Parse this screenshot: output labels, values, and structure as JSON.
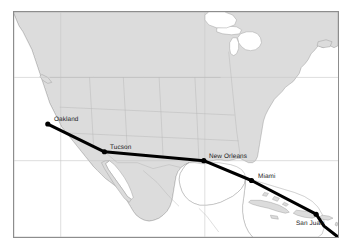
{
  "figure": {
    "type": "route-map",
    "title": "",
    "frame": {
      "x": 13,
      "y": 11,
      "width": 326,
      "height": 227
    },
    "colors": {
      "land": "#dcdcdc",
      "water": "#ffffff",
      "border_line": "#9a9a9a",
      "graticule": "#c8c8c8",
      "frame": "#8d8d8d",
      "route": "#000000",
      "label_text": "#1a1a1a"
    }
  },
  "map": {
    "name": "north-america-caribbean-basemap",
    "region_label": "North America and the Caribbean"
  },
  "route": {
    "name": "transcontinental-route",
    "style": "solid-thick-black",
    "stops": [
      {
        "label": "Oakland",
        "x": 47,
        "y": 124,
        "label_dx": 6,
        "label_dy": -9
      },
      {
        "label": "Tucson",
        "x": 104,
        "y": 152,
        "label_dx": 5,
        "label_dy": -9
      },
      {
        "label": "New Orleans",
        "x": 204,
        "y": 161,
        "label_dx": 4,
        "label_dy": -9
      },
      {
        "label": "Miami",
        "x": 252,
        "y": 181,
        "label_dx": 5,
        "label_dy": -9
      },
      {
        "label": "San Juan",
        "x": 317,
        "y": 215,
        "label_dx": -22,
        "label_dy": 4
      }
    ],
    "continues_offmap": true
  }
}
